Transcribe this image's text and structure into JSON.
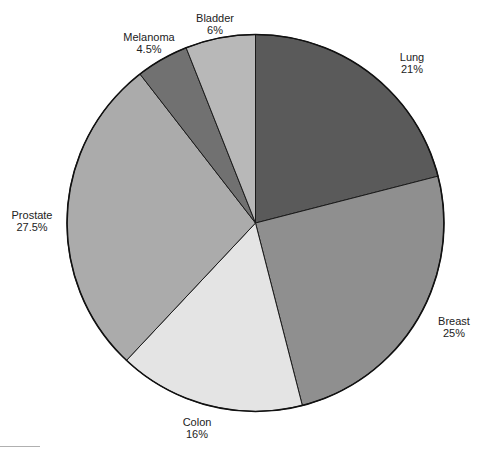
{
  "chart_data": {
    "type": "pie",
    "title": "",
    "start_angle_deg": 0,
    "direction": "clockwise",
    "slices": [
      {
        "label": "Lung",
        "value": 21,
        "display": "21%",
        "color": "#5a5a5a"
      },
      {
        "label": "Breast",
        "value": 25,
        "display": "25%",
        "color": "#8f8f8f"
      },
      {
        "label": "Colon",
        "value": 16,
        "display": "16%",
        "color": "#e4e4e4"
      },
      {
        "label": "Prostate",
        "value": 27.5,
        "display": "27.5%",
        "color": "#ababab"
      },
      {
        "label": "Melanoma",
        "value": 4.5,
        "display": "4.5%",
        "color": "#717171"
      },
      {
        "label": "Bladder",
        "value": 6,
        "display": "6%",
        "color": "#b8b8b8"
      }
    ],
    "categories": [
      "Lung",
      "Breast",
      "Colon",
      "Prostate",
      "Melanoma",
      "Bladder"
    ],
    "values": [
      21,
      25,
      16,
      27.5,
      4.5,
      6
    ],
    "unit": "%"
  },
  "labels": {
    "lung": {
      "name": "Lung",
      "pct": "21%"
    },
    "breast": {
      "name": "Breast",
      "pct": "25%"
    },
    "colon": {
      "name": "Colon",
      "pct": "16%"
    },
    "prostate": {
      "name": "Prostate",
      "pct": "27.5%"
    },
    "melanoma": {
      "name": "Melanoma",
      "pct": "4.5%"
    },
    "bladder": {
      "name": "Bladder",
      "pct": "6%"
    }
  }
}
